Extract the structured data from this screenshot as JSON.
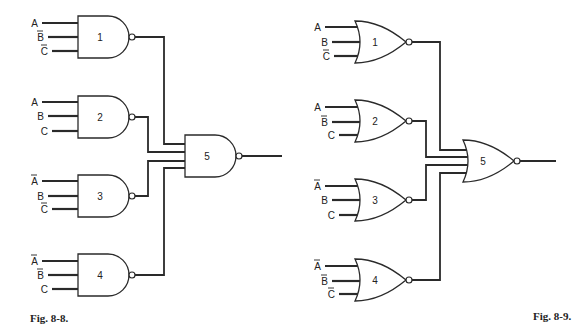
{
  "figures": [
    {
      "id": "fig-8-8",
      "caption": "Fig. 8-8.",
      "caption_pos": [
        30,
        322
      ],
      "gate_type": "NAND",
      "gates": [
        {
          "number": "1",
          "left": 78,
          "top": 16,
          "bottom": 58,
          "inputs": [
            {
              "label": "A",
              "bar": false,
              "y": 23,
              "x0": 42
            },
            {
              "label": "B",
              "bar": true,
              "y": 37,
              "x0": 48
            },
            {
              "label": "C",
              "bar": true,
              "y": 51,
              "x0": 52
            }
          ]
        },
        {
          "number": "2",
          "left": 78,
          "top": 96,
          "bottom": 138,
          "inputs": [
            {
              "label": "A",
              "bar": false,
              "y": 102,
              "x0": 42
            },
            {
              "label": "B",
              "bar": false,
              "y": 116,
              "x0": 48
            },
            {
              "label": "C",
              "bar": false,
              "y": 131,
              "x0": 52
            }
          ]
        },
        {
          "number": "3",
          "left": 78,
          "top": 175,
          "bottom": 217,
          "inputs": [
            {
              "label": "A",
              "bar": true,
              "y": 181,
              "x0": 42
            },
            {
              "label": "B",
              "bar": false,
              "y": 196,
              "x0": 48
            },
            {
              "label": "C",
              "bar": true,
              "y": 209,
              "x0": 52
            }
          ]
        },
        {
          "number": "4",
          "left": 78,
          "top": 254,
          "bottom": 296,
          "inputs": [
            {
              "label": "A",
              "bar": true,
              "y": 261,
              "x0": 42
            },
            {
              "label": "B",
              "bar": true,
              "y": 275,
              "x0": 48
            },
            {
              "label": "C",
              "bar": false,
              "y": 289,
              "x0": 52
            }
          ]
        },
        {
          "number": "5",
          "left": 185,
          "top": 135,
          "bottom": 177,
          "output_to": 282,
          "inputs": []
        }
      ],
      "routes": [
        {
          "from_gate": 0,
          "via_x": 164,
          "to_y": 144
        },
        {
          "from_gate": 1,
          "via_x": 148,
          "to_y": 152
        },
        {
          "from_gate": 2,
          "via_x": 148,
          "to_y": 161
        },
        {
          "from_gate": 3,
          "via_x": 164,
          "to_y": 168
        }
      ]
    },
    {
      "id": "fig-8-9",
      "caption": "Fig. 8-9.",
      "caption_pos": [
        533,
        320
      ],
      "gate_type": "NOR",
      "gates": [
        {
          "number": "1",
          "left": 355,
          "top": 21,
          "bottom": 63,
          "inputs": [
            {
              "label": "A",
              "bar": false,
              "y": 27,
              "x0": 325
            },
            {
              "label": "B",
              "bar": false,
              "y": 42,
              "x0": 332
            },
            {
              "label": "C",
              "bar": true,
              "y": 56,
              "x0": 334
            }
          ]
        },
        {
          "number": "2",
          "left": 355,
          "top": 100,
          "bottom": 142,
          "inputs": [
            {
              "label": "A",
              "bar": false,
              "y": 107,
              "x0": 325
            },
            {
              "label": "B",
              "bar": true,
              "y": 122,
              "x0": 332
            },
            {
              "label": "C",
              "bar": false,
              "y": 135,
              "x0": 339
            }
          ]
        },
        {
          "number": "3",
          "left": 355,
          "top": 179,
          "bottom": 221,
          "inputs": [
            {
              "label": "A",
              "bar": true,
              "y": 186,
              "x0": 325
            },
            {
              "label": "B",
              "bar": false,
              "y": 200,
              "x0": 332
            },
            {
              "label": "C",
              "bar": false,
              "y": 215,
              "x0": 339
            }
          ]
        },
        {
          "number": "4",
          "left": 355,
          "top": 259,
          "bottom": 301,
          "inputs": [
            {
              "label": "A",
              "bar": true,
              "y": 266,
              "x0": 325
            },
            {
              "label": "B",
              "bar": true,
              "y": 281,
              "x0": 332
            },
            {
              "label": "C",
              "bar": true,
              "y": 294,
              "x0": 339
            }
          ]
        },
        {
          "number": "5",
          "left": 463,
          "top": 140,
          "bottom": 182,
          "output_to": 556,
          "inputs": []
        }
      ],
      "routes": [
        {
          "from_gate": 0,
          "via_x": 440,
          "to_y": 150
        },
        {
          "from_gate": 1,
          "via_x": 426,
          "to_y": 157
        },
        {
          "from_gate": 2,
          "via_x": 426,
          "to_y": 165
        },
        {
          "from_gate": 3,
          "via_x": 440,
          "to_y": 173
        }
      ]
    }
  ]
}
